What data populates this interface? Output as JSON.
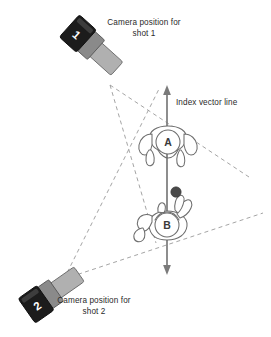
{
  "diagram": {
    "background_color": "#ffffff",
    "line_color": "#6d6d6d",
    "dash_color": "#9a9a9a",
    "camera_body_color": "#9c9c9c",
    "camera_dark_color": "#1a1a1a",
    "camera_mid_color": "#787878",
    "ball_color": "#4a4a4a",
    "text_color": "#2b2b2b"
  },
  "labels": {
    "camera1": "Camera position for\nshot 1",
    "camera2": "Camera position for\nshot 2",
    "index_vector": "Index vector line"
  },
  "cameras": [
    {
      "id": "camera-1",
      "number": "1",
      "position": "top-left",
      "rotation_deg": 42,
      "body_x": 70,
      "body_y": 22
    },
    {
      "id": "camera-2",
      "number": "2",
      "position": "bottom-left",
      "rotation_deg": -35,
      "body_x": 14,
      "body_y": 296
    }
  ],
  "subjects": [
    {
      "id": "person-a",
      "label": "A",
      "head_cx": 168,
      "head_cy": 142,
      "head_r": 12,
      "facing": "down"
    },
    {
      "id": "person-b",
      "label": "B",
      "head_cx": 167,
      "head_cy": 225,
      "head_r": 12,
      "facing": "up"
    }
  ],
  "objects": [
    {
      "id": "held-ball",
      "cx": 176,
      "cy": 192,
      "r": 5,
      "color": "#4a4a4a"
    }
  ],
  "index_vector_line": {
    "x": 167,
    "y_top": 86,
    "y_bottom": 274,
    "arrow_top": true,
    "arrow_bottom": true
  },
  "view_cones": [
    {
      "id": "cone-shot-1",
      "apex_x": 110,
      "apex_y": 85,
      "edge1_x": 155,
      "edge1_y": 240,
      "edge2_x": 247,
      "edge2_y": 175
    },
    {
      "id": "cone-shot-2",
      "apex_x": 65,
      "apex_y": 278,
      "edge1_x": 160,
      "edge1_y": 92,
      "edge2_x": 262,
      "edge2_y": 214
    }
  ]
}
